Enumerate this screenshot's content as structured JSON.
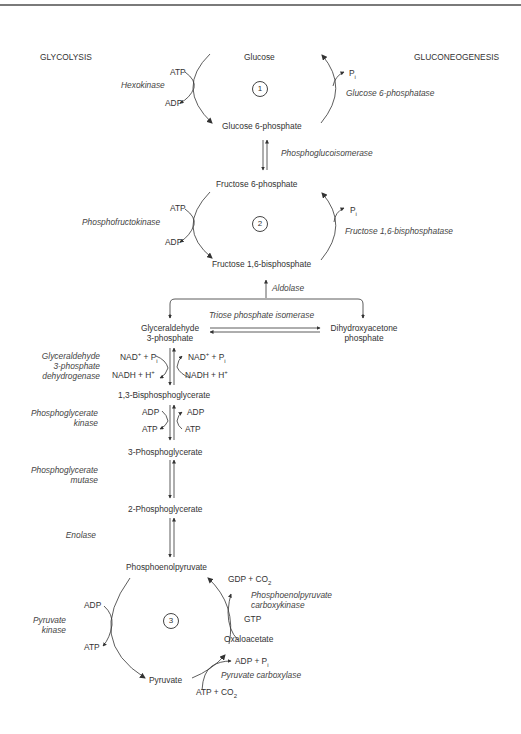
{
  "headers": {
    "left": "GLYCOLYSIS",
    "right": "GLUCONEOGENESIS"
  },
  "cycles": [
    {
      "number": "1"
    },
    {
      "number": "2"
    },
    {
      "number": "3"
    }
  ],
  "metabolites": {
    "glucose": "Glucose",
    "g6p": "Glucose 6-phosphate",
    "f6p": "Fructose 6-phosphate",
    "f16bp": "Fructose 1,6-bisphosphate",
    "gap_line1": "Glyceraldehyde",
    "gap_line2": "3-phosphate",
    "dhap_line1": "Dihydroxyacetone",
    "dhap_line2": "phosphate",
    "bpg": "1,3-Bisphosphoglycerate",
    "pg3": "3-Phosphoglycerate",
    "pg2": "2-Phosphoglycerate",
    "pep": "Phosphoenolpyruvate",
    "oaa": "Oxaloacetate",
    "pyruvate": "Pyruvate"
  },
  "enzymes": {
    "hexokinase": "Hexokinase",
    "g6pase": "Glucose 6-phosphatase",
    "pgi": "Phosphoglucoisomerase",
    "pfk": "Phosphofructokinase",
    "fbpase": "Fructose 1,6-bisphosphatase",
    "aldolase": "Aldolase",
    "tpi": "Triose phosphate isomerase",
    "gapdh_line1": "Glyceraldehyde",
    "gapdh_line2": "3-phosphate",
    "gapdh_line3": "dehydrogenase",
    "pgk_line1": "Phosphoglycerate",
    "pgk_line2": "kinase",
    "pgm_line1": "Phosphoglycerate",
    "pgm_line2": "mutase",
    "enolase": "Enolase",
    "pepck_line1": "Phosphoenolpyruvate",
    "pepck_line2": "carboxykinase",
    "pk_line1": "Pyruvate",
    "pk_line2": "kinase",
    "pc": "Pyruvate carboxylase"
  },
  "cofactors": {
    "c1_atp": "ATP",
    "c1_adp": "ADP",
    "c1_pi": "P",
    "c1_pi_sub": "i",
    "c2_atp": "ATP",
    "c2_adp": "ADP",
    "c2_pi": "P",
    "c2_pi_sub": "i",
    "gapdh_nad_left": "NAD",
    "gapdh_nad_left_rest": " + P",
    "gapdh_nadh_left": "NADH + H",
    "gapdh_nad_right": "NAD",
    "gapdh_nad_right_rest": " + P",
    "gapdh_nadh_right": "NADH + H",
    "plus_sup": "+",
    "i_sub": "i",
    "pgk_adp_left": "ADP",
    "pgk_atp_left": "ATP",
    "pgk_adp_right": "ADP",
    "pgk_atp_right": "ATP",
    "pk_adp": "ADP",
    "pk_atp": "ATP",
    "pepck_gdp": "GDP + CO",
    "pepck_gtp": "GTP",
    "pc_adp": "ADP + P",
    "pc_atp": "ATP + CO",
    "two_sub": "2"
  },
  "colors": {
    "line": "#333333",
    "rule": "#7a7a7a",
    "text": "#333333"
  }
}
